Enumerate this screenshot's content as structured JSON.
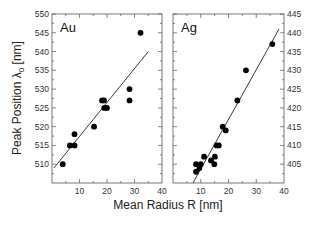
{
  "chart_data": [
    {
      "type": "scatter",
      "panel_label": "Au",
      "xlabel": "Mean Radius R [nm]",
      "ylabel": "Peak Position λ0 [nm]",
      "xlim": [
        0,
        40
      ],
      "ylim": [
        505,
        550
      ],
      "x_ticks": [
        10,
        20,
        30,
        40
      ],
      "x_tick_labels": [
        "10",
        "20",
        "30",
        "40"
      ],
      "y_ticks": [
        510,
        515,
        520,
        525,
        530,
        535,
        540,
        545,
        550
      ],
      "y_tick_labels": [
        "510",
        "515",
        "520",
        "525",
        "530",
        "535",
        "540",
        "545",
        "550"
      ],
      "y_axis_side": "left",
      "grid": false,
      "points": [
        {
          "x": 3.9,
          "y": 510
        },
        {
          "x": 6.5,
          "y": 515
        },
        {
          "x": 8.2,
          "y": 515
        },
        {
          "x": 8.2,
          "y": 518
        },
        {
          "x": 15.3,
          "y": 520
        },
        {
          "x": 18.2,
          "y": 527
        },
        {
          "x": 18.9,
          "y": 527
        },
        {
          "x": 19.0,
          "y": 525
        },
        {
          "x": 20.0,
          "y": 525
        },
        {
          "x": 28.2,
          "y": 530
        },
        {
          "x": 28.2,
          "y": 527
        },
        {
          "x": 32.2,
          "y": 545
        }
      ],
      "fit_line": {
        "x": [
          0.7,
          35.0
        ],
        "y": [
          509,
          540
        ]
      }
    },
    {
      "type": "scatter",
      "panel_label": "Ag",
      "xlabel": "Mean Radius R [nm]",
      "ylabel": "Peak Position λ0 [nm]",
      "xlim": [
        0,
        40
      ],
      "ylim": [
        400,
        445
      ],
      "x_ticks": [
        10,
        20,
        30,
        40
      ],
      "x_tick_labels": [
        "10",
        "20",
        "30",
        "40"
      ],
      "y_ticks": [
        405,
        410,
        415,
        420,
        425,
        430,
        435,
        440,
        445
      ],
      "y_tick_labels": [
        "405",
        "410",
        "415",
        "420",
        "425",
        "430",
        "435",
        "440",
        "445"
      ],
      "y_axis_side": "right",
      "grid": false,
      "points": [
        {
          "x": 8.3,
          "y": 405
        },
        {
          "x": 10.0,
          "y": 405
        },
        {
          "x": 8.3,
          "y": 403
        },
        {
          "x": 9.5,
          "y": 404
        },
        {
          "x": 11.2,
          "y": 407
        },
        {
          "x": 13.7,
          "y": 406
        },
        {
          "x": 15.1,
          "y": 407
        },
        {
          "x": 14.9,
          "y": 405
        },
        {
          "x": 15.7,
          "y": 410
        },
        {
          "x": 16.5,
          "y": 410
        },
        {
          "x": 17.9,
          "y": 415
        },
        {
          "x": 19.0,
          "y": 414
        },
        {
          "x": 23.2,
          "y": 422
        },
        {
          "x": 26.3,
          "y": 430
        },
        {
          "x": 35.8,
          "y": 437
        }
      ],
      "fit_line": {
        "x": [
          7.2,
          38.2
        ],
        "y": [
          400,
          441
        ]
      }
    }
  ],
  "labels": {
    "xlabel": "Mean Radius R [nm]",
    "ylabel_main": "Peak Position λ",
    "ylabel_sub": "0",
    "ylabel_unit": " [nm]",
    "panel_left": "Au",
    "panel_right": "Ag"
  }
}
